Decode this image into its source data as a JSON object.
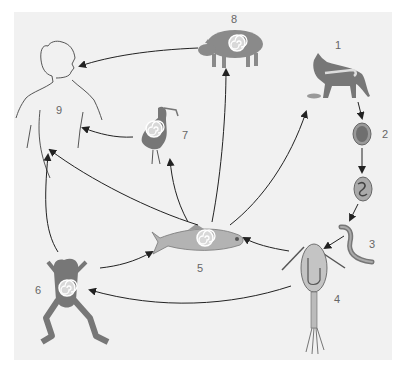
{
  "diagram": {
    "title": "",
    "type": "life-cycle",
    "stages": [
      {
        "id": 1,
        "label": "1",
        "name": "cat"
      },
      {
        "id": 2,
        "label": "2",
        "name": "egg"
      },
      {
        "id": 3,
        "label": "3",
        "name": "larva"
      },
      {
        "id": 4,
        "label": "4",
        "name": "copepod"
      },
      {
        "id": 5,
        "label": "5",
        "name": "fish"
      },
      {
        "id": 6,
        "label": "6",
        "name": "frog"
      },
      {
        "id": 7,
        "label": "7",
        "name": "bird"
      },
      {
        "id": 8,
        "label": "8",
        "name": "pig"
      },
      {
        "id": 9,
        "label": "9",
        "name": "human"
      }
    ],
    "edges": [
      {
        "from": 1,
        "to": 2
      },
      {
        "from": 2,
        "to": "2b"
      },
      {
        "from": "2b",
        "to": 3
      },
      {
        "from": 3,
        "to": 4
      },
      {
        "from": 4,
        "to": 5
      },
      {
        "from": 4,
        "to": 6
      },
      {
        "from": 5,
        "to": 1
      },
      {
        "from": 5,
        "to": 7
      },
      {
        "from": 5,
        "to": 8
      },
      {
        "from": 5,
        "to": 9
      },
      {
        "from": 6,
        "to": 5
      },
      {
        "from": 6,
        "to": 9
      },
      {
        "from": 7,
        "to": 9
      },
      {
        "from": 8,
        "to": 9
      }
    ],
    "colors": {
      "background": "#f1f1f1",
      "animal_fill": "#8a8a8a",
      "fish_fill": "#b3b3b3",
      "arrow": "#222222",
      "label": "#666666"
    }
  }
}
